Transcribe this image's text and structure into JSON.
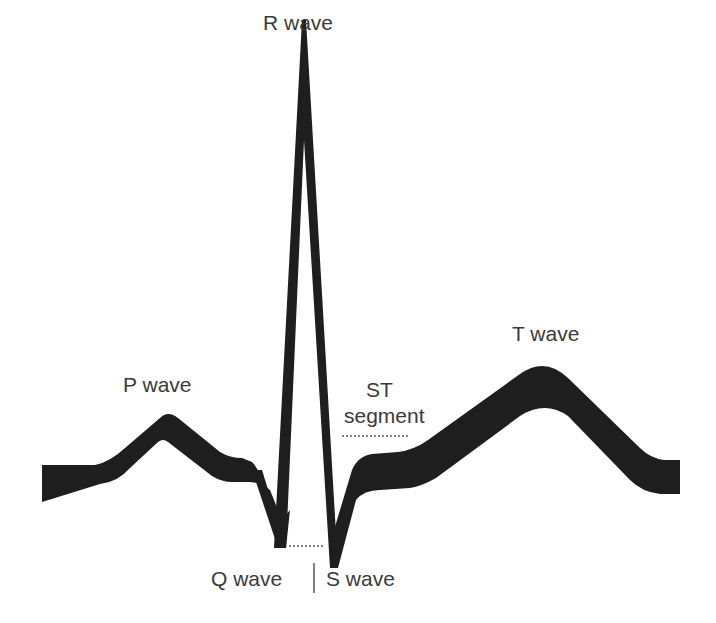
{
  "diagram": {
    "trace_color": "#1e1e1e",
    "label_color": "#3a3a3a",
    "labels": {
      "r_wave": "R wave",
      "p_wave": "P wave",
      "st_segment_line1": "ST",
      "st_segment_line2": "segment",
      "t_wave": "T wave",
      "q_wave": "Q wave",
      "separator": "|",
      "s_wave": "S wave"
    }
  }
}
